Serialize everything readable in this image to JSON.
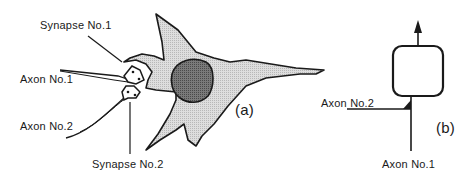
{
  "figure": {
    "panel_a": {
      "label": "(a)",
      "title": "Biological neuron with two synapses",
      "labels": {
        "synapse1": "Synapse No.1",
        "axon1": "Axon No.1",
        "axon2": "Axon No.2",
        "synapse2": "Synapse No.2"
      },
      "colors": {
        "cell_body": "#d2d2d2",
        "nucleus": "#6e6e6e",
        "outline": "#1a1a1a"
      }
    },
    "panel_b": {
      "label": "(b)",
      "title": "Abstract neuron model",
      "labels": {
        "axon2": "Axon No.2",
        "axon1": "Axon No.1"
      }
    }
  }
}
